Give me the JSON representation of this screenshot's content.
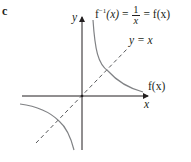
{
  "figure": {
    "part_label": "c",
    "axes": {
      "x_label": "x",
      "y_label": "y"
    },
    "curve_label": {
      "lhs": "f",
      "lhs_sup": "−1",
      "arg": "(x)",
      "eq1": "=",
      "frac_num": "1",
      "frac_den": "x",
      "eq2": "=",
      "rhs": "f(x)"
    },
    "line_label": "y = x",
    "branch_label": "f(x)",
    "colors": {
      "axes": "#231f20",
      "curve": "#808285",
      "dashed": "#58595b"
    }
  }
}
